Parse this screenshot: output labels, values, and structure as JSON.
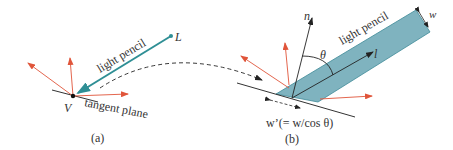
{
  "figure": {
    "panel_a": {
      "caption": "(a)",
      "labels": {
        "light_pencil": "light pencil",
        "light_point": "L",
        "vertex": "V",
        "tangent_plane": "tangent plane"
      }
    },
    "panel_b": {
      "caption": "(b)",
      "labels": {
        "light_pencil": "light pencil",
        "normal": "n",
        "direction": "l",
        "angle": "θ",
        "width": "w",
        "projected_width": "w’(= w/cos θ)"
      }
    },
    "colors": {
      "pencil_fill": "#7fb3bf",
      "pencil_stroke": "#3f8a98",
      "arrow_teal": "#2f8f95",
      "reflect_red": "#e0553a",
      "line": "#333333"
    }
  }
}
